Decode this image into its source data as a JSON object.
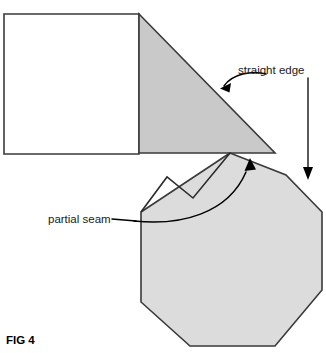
{
  "figure": {
    "caption": "FIG 4",
    "background_color": "#ffffff"
  },
  "labels": {
    "straight_edge": "straight edge",
    "partial_seam": "partial seam"
  },
  "colors": {
    "triangle_fill": "#c9c9c9",
    "octagon_fill": "#dcdcdc",
    "rectangle_fill": "#ffffff",
    "outline": "#3a3a3a",
    "annotation": "#000000",
    "text": "#1a1a1a"
  },
  "shapes": {
    "rectangle": {
      "name": "white rectangle panel",
      "points": "4,14 139,14 139,154 4,154"
    },
    "triangle": {
      "name": "shaded right triangle",
      "points": "139,14 275,153 139,153"
    },
    "octagon": {
      "name": "shaded octagon panel",
      "points": "230,153 286,175 322,212 322,290 275,346 190,346 141,302 141,212"
    },
    "seam": {
      "name": "partial seam V fold line",
      "points": "141,212 167,177 193,198 230,153"
    }
  },
  "annotations": {
    "straight_edge_arrow": {
      "name": "curved arrow to straight edge",
      "path": "M 266,74 C 252,70 232,74 224,86",
      "arrow_tip": "222,88"
    },
    "vertical_arrow": {
      "name": "vertical arrow to hypotenuse",
      "path": "M 308,78 L 308,170",
      "arrow_tip": "308,179"
    },
    "partial_seam_leader": {
      "name": "curved leader arrow to seam",
      "path": "M 134,221 C 180,226 228,214 246,172",
      "arrow_tip": "250,161"
    }
  }
}
